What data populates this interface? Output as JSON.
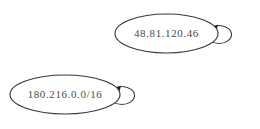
{
  "graph": {
    "background_color": "#ffffff",
    "node_stroke_color": "#3a3a3a",
    "label_color": "#4a4a4a",
    "arrow_color": "#1c1c1c",
    "nodes": [
      {
        "id": "node-ip-host",
        "label": "48.81.120.46",
        "cx": 166.5,
        "cy": 33.5,
        "rx": 51.5,
        "ry": 19.5,
        "self_loop": {
          "cx": 219.0,
          "cy": 34.5,
          "rx": 12.5,
          "ry": 9.0,
          "arrow_x": 211.5,
          "arrow_y": 29.0
        }
      },
      {
        "id": "node-ip-prefix",
        "label": "180.216.0.0/16",
        "cx": 65.0,
        "cy": 94.5,
        "rx": 55.0,
        "ry": 19.5,
        "self_loop": {
          "cx": 122.0,
          "cy": 95.5,
          "rx": 12.5,
          "ry": 9.0,
          "arrow_x": 114.5,
          "arrow_y": 90.0
        }
      }
    ]
  }
}
